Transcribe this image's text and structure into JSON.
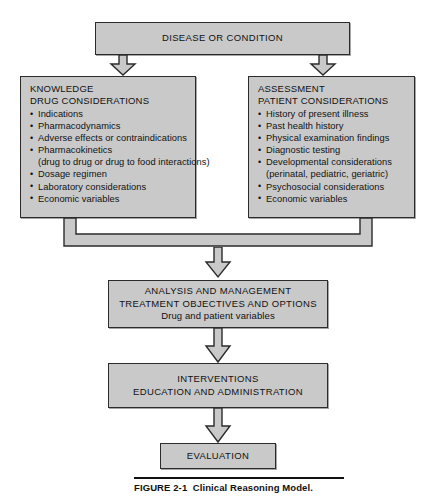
{
  "figure": {
    "label": "FIGURE 2-1",
    "title": "Clinical Reasoning Model."
  },
  "colors": {
    "box_fill": "#c9c9c9",
    "box_border": "#2b2b2b",
    "text": "#111111",
    "page_background": "#ffffff"
  },
  "nodes": {
    "disease": {
      "text": "DISEASE OR CONDITION"
    },
    "knowledge": {
      "heading_line1": "KNOWLEDGE",
      "heading_line2": "DRUG CONSIDERATIONS",
      "items": [
        {
          "text": "Indications",
          "bullet": true
        },
        {
          "text": "Pharmacodynamics",
          "bullet": true
        },
        {
          "text": "Adverse effects or contraindications",
          "bullet": true
        },
        {
          "text": "Pharmacokinetics",
          "bullet": true
        },
        {
          "text": "(drug to drug or drug to food interactions)",
          "bullet": false
        },
        {
          "text": "Dosage regimen",
          "bullet": true
        },
        {
          "text": "Laboratory considerations",
          "bullet": true
        },
        {
          "text": "Economic variables",
          "bullet": true
        }
      ]
    },
    "assessment": {
      "heading_line1": "ASSESSMENT",
      "heading_line2": "PATIENT CONSIDERATIONS",
      "items": [
        {
          "text": "History of present illness",
          "bullet": true
        },
        {
          "text": "Past health history",
          "bullet": true
        },
        {
          "text": "Physical examination findings",
          "bullet": true
        },
        {
          "text": "Diagnostic testing",
          "bullet": true
        },
        {
          "text": "Developmental considerations",
          "bullet": true
        },
        {
          "text": "(perinatal, pediatric, geriatric)",
          "bullet": false
        },
        {
          "text": "Psychosocial considerations",
          "bullet": true
        },
        {
          "text": "Economic variables",
          "bullet": true
        }
      ]
    },
    "analysis": {
      "line1": "ANALYSIS AND MANAGEMENT",
      "line2": "TREATMENT OBJECTIVES AND OPTIONS",
      "line3": "Drug and patient variables"
    },
    "interventions": {
      "line1": "INTERVENTIONS",
      "line2": "EDUCATION AND ADMINISTRATION"
    },
    "evaluation": {
      "line1": "EVALUATION"
    }
  },
  "connectors": [
    {
      "name": "disease-to-knowledge",
      "type": "block-arrow-down"
    },
    {
      "name": "disease-to-assessment",
      "type": "block-arrow-down"
    },
    {
      "name": "knowledge-assessment-merge",
      "type": "merge-band"
    },
    {
      "name": "merge-to-analysis",
      "type": "block-arrow-down"
    },
    {
      "name": "analysis-to-interventions",
      "type": "block-arrow-down"
    },
    {
      "name": "interventions-to-evaluation",
      "type": "block-arrow-down"
    }
  ]
}
